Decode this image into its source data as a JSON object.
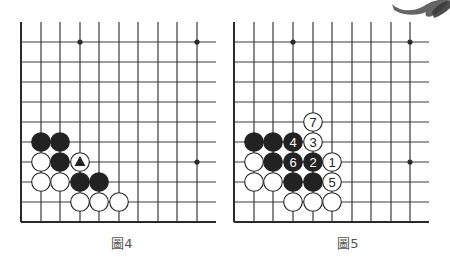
{
  "colors": {
    "line": "#3a3a3a",
    "edge": "#2a2a2a",
    "black_stone": "#222222",
    "white_stone": "#ffffff",
    "stone_outline": "#222222",
    "brush": "#4a4a4a"
  },
  "boards": [
    {
      "id": "fig4",
      "caption": "圖4",
      "caption_x": 122,
      "origin_x": 21,
      "cols_x": [
        21,
        41,
        60,
        80,
        99,
        119,
        138,
        158,
        177,
        197
      ],
      "right_end": 216,
      "rows_y": [
        42,
        62,
        82,
        102,
        122,
        142,
        162,
        182,
        202,
        222
      ],
      "top_y": 22,
      "star_points": [
        [
          197,
          42
        ],
        [
          80,
          42
        ],
        [
          197,
          162
        ]
      ],
      "stones": [
        {
          "x": 41,
          "y": 142,
          "color": "black"
        },
        {
          "x": 60,
          "y": 142,
          "color": "black"
        },
        {
          "x": 41,
          "y": 162,
          "color": "white"
        },
        {
          "x": 60,
          "y": 162,
          "color": "black"
        },
        {
          "x": 80,
          "y": 162,
          "color": "white",
          "mark": "triangle"
        },
        {
          "x": 41,
          "y": 182,
          "color": "white"
        },
        {
          "x": 60,
          "y": 182,
          "color": "white"
        },
        {
          "x": 80,
          "y": 182,
          "color": "black"
        },
        {
          "x": 99,
          "y": 182,
          "color": "black"
        },
        {
          "x": 80,
          "y": 202,
          "color": "white"
        },
        {
          "x": 99,
          "y": 202,
          "color": "white"
        },
        {
          "x": 119,
          "y": 202,
          "color": "white"
        }
      ]
    },
    {
      "id": "fig5",
      "caption": "圖5",
      "caption_x": 348,
      "origin_x": 234,
      "cols_x": [
        234,
        254,
        273,
        293,
        313,
        332,
        352,
        371,
        391,
        410
      ],
      "right_end": 429,
      "rows_y": [
        42,
        62,
        82,
        102,
        122,
        142,
        162,
        182,
        202,
        222
      ],
      "top_y": 22,
      "star_points": [
        [
          293,
          42
        ],
        [
          410,
          42
        ],
        [
          410,
          162
        ]
      ],
      "stones": [
        {
          "x": 313,
          "y": 122,
          "color": "white",
          "label": "7"
        },
        {
          "x": 254,
          "y": 142,
          "color": "black"
        },
        {
          "x": 273,
          "y": 142,
          "color": "black"
        },
        {
          "x": 293,
          "y": 142,
          "color": "black",
          "label": "4"
        },
        {
          "x": 313,
          "y": 142,
          "color": "white",
          "label": "3"
        },
        {
          "x": 254,
          "y": 162,
          "color": "white"
        },
        {
          "x": 273,
          "y": 162,
          "color": "black"
        },
        {
          "x": 293,
          "y": 162,
          "color": "black",
          "label": "6"
        },
        {
          "x": 313,
          "y": 162,
          "color": "black",
          "label": "2"
        },
        {
          "x": 332,
          "y": 162,
          "color": "white",
          "label": "1"
        },
        {
          "x": 254,
          "y": 182,
          "color": "white"
        },
        {
          "x": 273,
          "y": 182,
          "color": "white"
        },
        {
          "x": 293,
          "y": 182,
          "color": "black"
        },
        {
          "x": 313,
          "y": 182,
          "color": "black"
        },
        {
          "x": 332,
          "y": 182,
          "color": "white",
          "label": "5"
        },
        {
          "x": 293,
          "y": 202,
          "color": "white"
        },
        {
          "x": 313,
          "y": 202,
          "color": "white"
        },
        {
          "x": 332,
          "y": 202,
          "color": "white"
        }
      ]
    }
  ]
}
